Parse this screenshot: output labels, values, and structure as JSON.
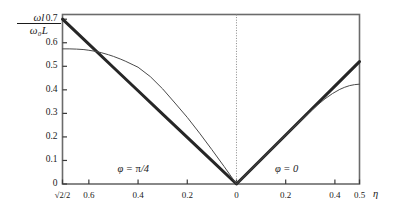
{
  "chart_data": {
    "type": "line",
    "title": "",
    "xlabel": "η",
    "ylabel_numerator": "ωl",
    "ylabel_denominator": "ω₀L",
    "grid": false,
    "legend": "none",
    "xlim": [
      -0.7071,
      0.5
    ],
    "ylim": [
      0,
      0.72
    ],
    "yticks": [
      0,
      0.1,
      0.2,
      0.3,
      0.4,
      0.5,
      0.6,
      0.7
    ],
    "ytick_labels": [
      "0",
      "0.1",
      "0.2",
      "0.3",
      "0.4",
      "0.5",
      "0.6",
      "0.7"
    ],
    "xticks": [
      -0.7071,
      -0.6,
      -0.4,
      -0.2,
      0,
      0.2,
      0.4,
      0.5
    ],
    "xtick_labels": [
      "√2/2",
      "0.6",
      "0.4",
      "0.2",
      "0",
      "0.2",
      "0.4",
      "0.5"
    ],
    "annotations": [
      {
        "text": "φ = π/4",
        "x": -0.37,
        "y": 0.055
      },
      {
        "text": "φ = 0",
        "x": 0.27,
        "y": 0.055
      }
    ],
    "reference_lines": [
      {
        "orientation": "vertical",
        "x": 0,
        "style": "dotted",
        "color": "#888888"
      }
    ],
    "series": [
      {
        "name": "asymptote-linear",
        "style": "thick-solid",
        "color": "#262626",
        "width": 3.0,
        "points": [
          [
            -0.7071,
            0.7
          ],
          [
            -0.6,
            0.594
          ],
          [
            -0.5,
            0.495
          ],
          [
            -0.4,
            0.396
          ],
          [
            -0.3,
            0.297
          ],
          [
            -0.2,
            0.198
          ],
          [
            -0.1,
            0.099
          ],
          [
            0.0,
            0.0
          ],
          [
            0.1,
            0.104
          ],
          [
            0.2,
            0.208
          ],
          [
            0.3,
            0.312
          ],
          [
            0.4,
            0.416
          ],
          [
            0.5,
            0.52
          ]
        ]
      },
      {
        "name": "dispersion-curve",
        "style": "thin-solid",
        "color": "#4a4a4a",
        "width": 1.0,
        "points": [
          [
            -0.7071,
            0.574
          ],
          [
            -0.68,
            0.574
          ],
          [
            -0.65,
            0.573
          ],
          [
            -0.62,
            0.571
          ],
          [
            -0.6,
            0.568
          ],
          [
            -0.57,
            0.563
          ],
          [
            -0.55,
            0.558
          ],
          [
            -0.52,
            0.549
          ],
          [
            -0.5,
            0.542
          ],
          [
            -0.47,
            0.53
          ],
          [
            -0.45,
            0.521
          ],
          [
            -0.42,
            0.506
          ],
          [
            -0.4,
            0.496
          ],
          [
            -0.35,
            0.456
          ],
          [
            -0.3,
            0.404
          ],
          [
            -0.25,
            0.344
          ],
          [
            -0.2,
            0.283
          ],
          [
            -0.15,
            0.216
          ],
          [
            -0.1,
            0.146
          ],
          [
            -0.05,
            0.074
          ],
          [
            0.0,
            0.0
          ],
          [
            0.05,
            0.052
          ],
          [
            0.1,
            0.104
          ],
          [
            0.15,
            0.156
          ],
          [
            0.2,
            0.208
          ],
          [
            0.25,
            0.259
          ],
          [
            0.3,
            0.308
          ],
          [
            0.33,
            0.336
          ],
          [
            0.36,
            0.362
          ],
          [
            0.39,
            0.384
          ],
          [
            0.42,
            0.402
          ],
          [
            0.44,
            0.411
          ],
          [
            0.46,
            0.418
          ],
          [
            0.48,
            0.422
          ],
          [
            0.5,
            0.424
          ]
        ]
      }
    ]
  },
  "axes": {
    "frame_color": "#5a5a5a",
    "tick_color": "#3a3a3a"
  }
}
